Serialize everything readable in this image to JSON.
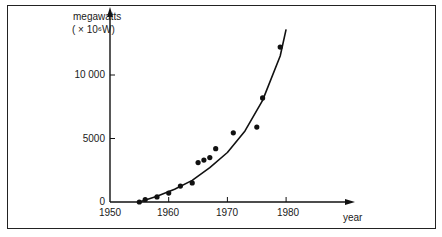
{
  "chart_data": {
    "type": "scatter",
    "title": "",
    "xlabel": "year",
    "ylabel": "megawatts",
    "ylabel_unit": "( × 10⁶W)",
    "x_ticks": [
      1950,
      1960,
      1970,
      1980
    ],
    "y_ticks": [
      0,
      5000,
      10000
    ],
    "y_tick_labels": [
      "0",
      "5000",
      "10 000"
    ],
    "xlim": [
      1950,
      1987
    ],
    "ylim": [
      0,
      14500
    ],
    "grid": false,
    "legend": null,
    "series": [
      {
        "name": "observed",
        "kind": "points",
        "x": [
          1955,
          1956,
          1958,
          1960,
          1962,
          1964,
          1965,
          1966,
          1967,
          1968,
          1971,
          1975,
          1976,
          1979
        ],
        "y": [
          0,
          200,
          400,
          700,
          1250,
          1500,
          3100,
          3300,
          3500,
          4200,
          5450,
          5900,
          8200,
          12200
        ]
      },
      {
        "name": "exponential fit",
        "kind": "curve",
        "x": [
          1955,
          1958,
          1961,
          1964,
          1967,
          1970,
          1973,
          1976,
          1979,
          1980
        ],
        "y": [
          0,
          450,
          1000,
          1700,
          2700,
          3900,
          5600,
          8000,
          11500,
          13600
        ]
      }
    ]
  },
  "labels": {
    "ylabel_line1": "megawatts",
    "ylabel_line2": "( × 10⁶W)",
    "xlabel": "year",
    "yticks": [
      "10 000",
      "5000",
      "0"
    ],
    "xticks": [
      "1950",
      "1960",
      "1970",
      "1980"
    ]
  }
}
